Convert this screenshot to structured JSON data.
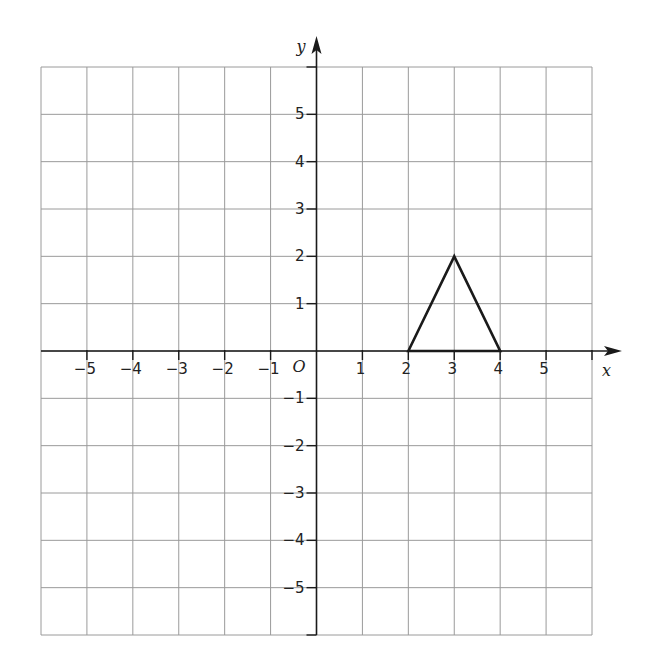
{
  "diagram": {
    "type": "coordinate-grid",
    "x_axis_label": "x",
    "y_axis_label": "y",
    "origin_label": "O",
    "x_range": [
      -6,
      6
    ],
    "y_range": [
      -6,
      6
    ],
    "x_tick_labels": [
      "−5",
      "−4",
      "−3",
      "−2",
      "−1",
      "1",
      "2",
      "3",
      "4",
      "5"
    ],
    "x_tick_values": [
      -5,
      -4,
      -3,
      -2,
      -1,
      1,
      2,
      3,
      4,
      5
    ],
    "y_tick_labels": [
      "5",
      "4",
      "3",
      "2",
      "1",
      "−1",
      "−2",
      "−3",
      "−4",
      "−5"
    ],
    "y_tick_values": [
      5,
      4,
      3,
      2,
      1,
      -1,
      -2,
      -3,
      -4,
      -5
    ],
    "shapes": [
      {
        "name": "triangle",
        "vertices": [
          [
            2,
            0
          ],
          [
            3,
            2
          ],
          [
            4,
            0
          ]
        ]
      }
    ],
    "colors": {
      "grid": "#9a9a9a",
      "axis": "#1a1a1a",
      "shape": "#1a1a1a",
      "background": "#ffffff"
    }
  }
}
